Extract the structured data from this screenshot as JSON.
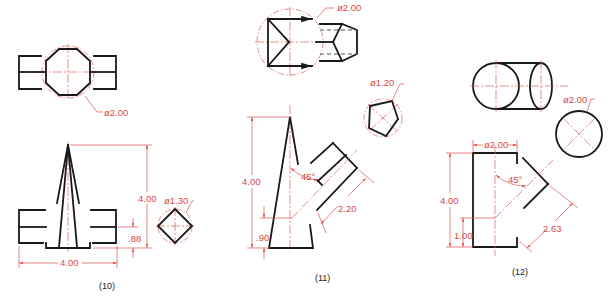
{
  "figures": [
    {
      "caption": "(10)",
      "top_view": {
        "shape": "octagon",
        "diameter_label": "ø2.00"
      },
      "front_view": {
        "height_label": "4.00",
        "offset_label": ".88",
        "width_label": "4.00"
      },
      "aux_view": {
        "shape": "square",
        "diameter_label": "ø1.30"
      }
    },
    {
      "caption": "(11)",
      "top_view": {
        "shape": "triangular-pyramid",
        "diameter_label": "ø2.00"
      },
      "front_view": {
        "height_label": "4.00",
        "offset_label": ".90",
        "angle_label": "45°",
        "length_label": "2.20"
      },
      "aux_view": {
        "shape": "pentagon",
        "diameter_label": "ø1.20"
      }
    },
    {
      "caption": "(12)",
      "top_view": {
        "shape": "cylinder"
      },
      "front_view": {
        "width_label": "ø2.00",
        "height_label": "4.00",
        "offset_label": "1.00",
        "angle_label": "45°",
        "length_label": "2.63"
      },
      "aux_view": {
        "shape": "circle",
        "diameter_label": "ø2.00"
      }
    }
  ],
  "colors": {
    "object_line": "#1a1a1a",
    "dimension_line": "#e05050",
    "center_line": "#e06060",
    "background": "#ffffff"
  }
}
